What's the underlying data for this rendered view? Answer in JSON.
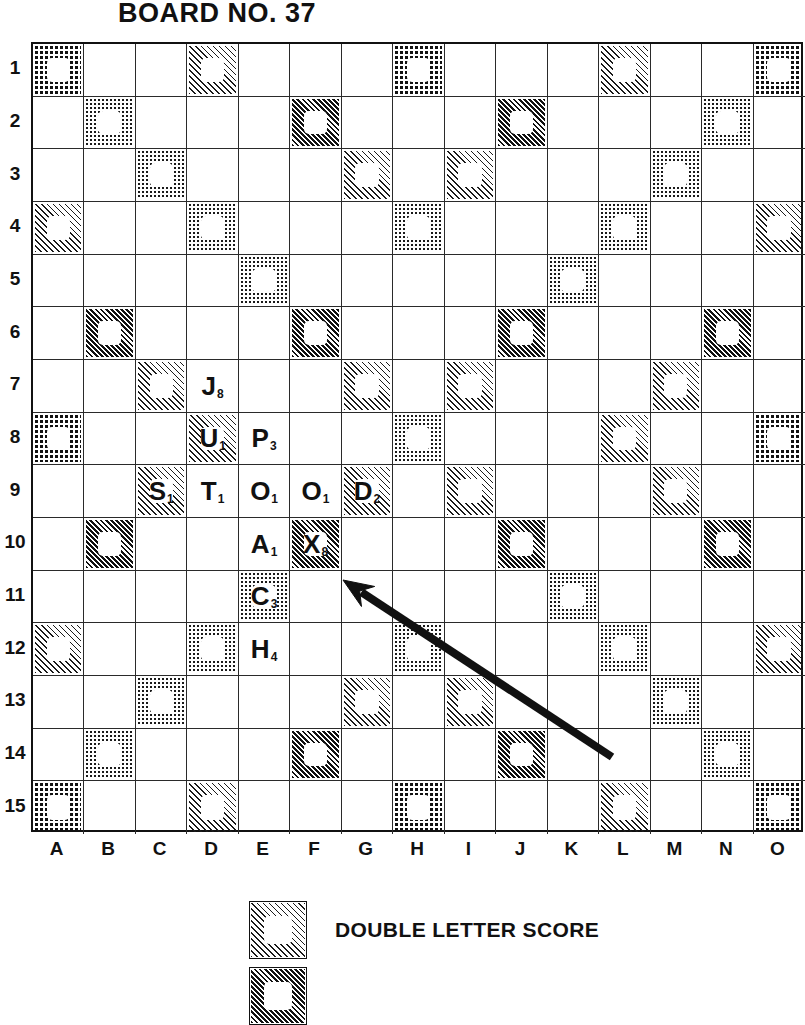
{
  "title": "BOARD NO. 37",
  "board": {
    "columns": [
      "A",
      "B",
      "C",
      "D",
      "E",
      "F",
      "G",
      "H",
      "I",
      "J",
      "K",
      "L",
      "M",
      "N",
      "O"
    ],
    "rows": [
      "1",
      "2",
      "3",
      "4",
      "5",
      "6",
      "7",
      "8",
      "9",
      "10",
      "11",
      "12",
      "13",
      "14",
      "15"
    ],
    "size": 15,
    "square_types": {
      "TW": "dotdark",
      "TL": "hatchdark",
      "DW": "dot",
      "DL": "hatch",
      "plain": "none"
    },
    "special_squares": [
      {
        "cell": "A1",
        "type": "TW"
      },
      {
        "cell": "D1",
        "type": "DL"
      },
      {
        "cell": "H1",
        "type": "TW"
      },
      {
        "cell": "L1",
        "type": "DL"
      },
      {
        "cell": "O1",
        "type": "TW"
      },
      {
        "cell": "B2",
        "type": "DW"
      },
      {
        "cell": "F2",
        "type": "TL"
      },
      {
        "cell": "J2",
        "type": "TL"
      },
      {
        "cell": "N2",
        "type": "DW"
      },
      {
        "cell": "C3",
        "type": "DW"
      },
      {
        "cell": "G3",
        "type": "DL"
      },
      {
        "cell": "I3",
        "type": "DL"
      },
      {
        "cell": "M3",
        "type": "DW"
      },
      {
        "cell": "A4",
        "type": "DL"
      },
      {
        "cell": "D4",
        "type": "DW"
      },
      {
        "cell": "H4",
        "type": "DW"
      },
      {
        "cell": "L4",
        "type": "DW"
      },
      {
        "cell": "O4",
        "type": "DL"
      },
      {
        "cell": "E5",
        "type": "DW"
      },
      {
        "cell": "K5",
        "type": "DW"
      },
      {
        "cell": "B6",
        "type": "TL"
      },
      {
        "cell": "F6",
        "type": "TL"
      },
      {
        "cell": "J6",
        "type": "TL"
      },
      {
        "cell": "N6",
        "type": "TL"
      },
      {
        "cell": "C7",
        "type": "DL"
      },
      {
        "cell": "G7",
        "type": "DL"
      },
      {
        "cell": "I7",
        "type": "DL"
      },
      {
        "cell": "M7",
        "type": "DL"
      },
      {
        "cell": "A8",
        "type": "TW"
      },
      {
        "cell": "D8",
        "type": "DL"
      },
      {
        "cell": "H8",
        "type": "DW"
      },
      {
        "cell": "L8",
        "type": "DL"
      },
      {
        "cell": "O8",
        "type": "TW"
      },
      {
        "cell": "C9",
        "type": "DL"
      },
      {
        "cell": "G9",
        "type": "DL"
      },
      {
        "cell": "I9",
        "type": "DL"
      },
      {
        "cell": "M9",
        "type": "DL"
      },
      {
        "cell": "B10",
        "type": "TL"
      },
      {
        "cell": "F10",
        "type": "TL"
      },
      {
        "cell": "J10",
        "type": "TL"
      },
      {
        "cell": "N10",
        "type": "TL"
      },
      {
        "cell": "E11",
        "type": "DW"
      },
      {
        "cell": "K11",
        "type": "DW"
      },
      {
        "cell": "A12",
        "type": "DL"
      },
      {
        "cell": "D12",
        "type": "DW"
      },
      {
        "cell": "H12",
        "type": "DW"
      },
      {
        "cell": "L12",
        "type": "DW"
      },
      {
        "cell": "O12",
        "type": "DL"
      },
      {
        "cell": "C13",
        "type": "DW"
      },
      {
        "cell": "G13",
        "type": "DL"
      },
      {
        "cell": "I13",
        "type": "DL"
      },
      {
        "cell": "M13",
        "type": "DW"
      },
      {
        "cell": "B14",
        "type": "DW"
      },
      {
        "cell": "F14",
        "type": "TL"
      },
      {
        "cell": "J14",
        "type": "TL"
      },
      {
        "cell": "N14",
        "type": "DW"
      },
      {
        "cell": "A15",
        "type": "TW"
      },
      {
        "cell": "D15",
        "type": "DL"
      },
      {
        "cell": "H15",
        "type": "TW"
      },
      {
        "cell": "L15",
        "type": "DL"
      },
      {
        "cell": "O15",
        "type": "TW"
      }
    ],
    "tiles": [
      {
        "cell": "D7",
        "letter": "J",
        "value": "8"
      },
      {
        "cell": "D8",
        "letter": "U",
        "value": "1"
      },
      {
        "cell": "E8",
        "letter": "P",
        "value": "3"
      },
      {
        "cell": "C9",
        "letter": "S",
        "value": "1"
      },
      {
        "cell": "D9",
        "letter": "T",
        "value": "1"
      },
      {
        "cell": "E9",
        "letter": "O",
        "value": "1"
      },
      {
        "cell": "F9",
        "letter": "O",
        "value": "1"
      },
      {
        "cell": "G9",
        "letter": "D",
        "value": "2"
      },
      {
        "cell": "E10",
        "letter": "A",
        "value": "1"
      },
      {
        "cell": "F10",
        "letter": "X",
        "value": "8"
      },
      {
        "cell": "E11",
        "letter": "C",
        "value": "3"
      },
      {
        "cell": "E12",
        "letter": "H",
        "value": "4"
      }
    ],
    "annotation_arrow": {
      "name": "pointer-arrow",
      "from_x": 612,
      "from_y": 757,
      "to_x": 343,
      "to_y": 580
    }
  },
  "legend": [
    {
      "label": "DOUBLE LETTER SCORE",
      "pattern": "hatch"
    },
    {
      "label": "",
      "pattern": "hatchdark"
    }
  ],
  "colors": {
    "ink": "#111111",
    "grid_line": "#2a2a2a",
    "paper": "#ffffff"
  }
}
